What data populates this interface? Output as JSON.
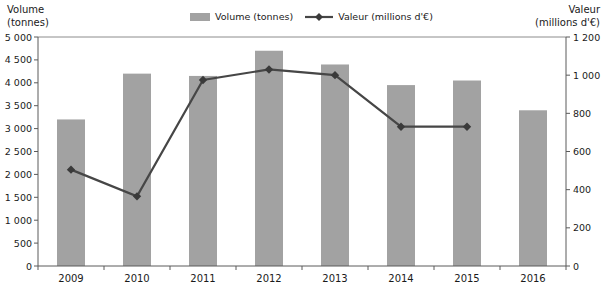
{
  "titles": {
    "left_line1": "Volume",
    "left_line2": "(tonnes)",
    "right_line1": "Valeur",
    "right_line2": "(millions d'€)"
  },
  "legend": {
    "items": [
      {
        "type": "bar",
        "label": "Volume (tonnes)"
      },
      {
        "type": "line",
        "label": "Valeur (millions d'€)"
      }
    ]
  },
  "chart_data": {
    "type": "bar+line combo",
    "categories": [
      "2009",
      "2010",
      "2011",
      "2012",
      "2013",
      "2014",
      "2015",
      "2016"
    ],
    "series": [
      {
        "name": "Volume (tonnes)",
        "type": "bar",
        "axis": "left",
        "color": "#a2a2a2",
        "values": [
          3200,
          4200,
          4150,
          4700,
          4400,
          3950,
          4050,
          3400
        ]
      },
      {
        "name": "Valeur (millions d'€)",
        "type": "line",
        "axis": "right",
        "color": "#464646",
        "marker": "diamond",
        "marker_color": "#3a3a3a",
        "values": [
          505,
          365,
          975,
          1030,
          1000,
          730,
          730,
          null
        ]
      }
    ],
    "left_axis": {
      "title": "Volume (tonnes)",
      "min": 0,
      "max": 5000,
      "step": 500,
      "tick_labels": [
        "0",
        "500",
        "1 000",
        "1 500",
        "2 000",
        "2 500",
        "3 000",
        "3 500",
        "4 000",
        "4 500",
        "5 000"
      ]
    },
    "right_axis": {
      "title": "Valeur (millions d'€)",
      "min": 0,
      "max": 1200,
      "step": 200,
      "tick_labels": [
        "0",
        "200",
        "400",
        "600",
        "800",
        "1 000",
        "1 200"
      ]
    },
    "grid": "top gridline only, no interior gridlines",
    "legend_position": "top-center",
    "style": {
      "bar_width": 28,
      "axis_color": "#5a5a5a",
      "grid_color": "#8c8c8c",
      "text_color": "#1a1a1a",
      "tick_font_size": 9.5,
      "xlabel_font_size": 10
    }
  }
}
